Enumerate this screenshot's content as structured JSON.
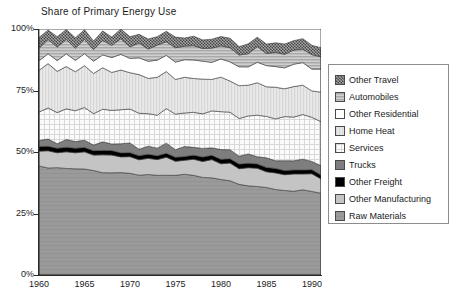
{
  "chart_data": {
    "type": "area",
    "stacked": true,
    "normalized_percent": true,
    "title": "Share of Primary Energy Use",
    "xlabel": "",
    "ylabel": "",
    "xlim": [
      1960,
      1991
    ],
    "ylim": [
      0,
      100
    ],
    "grid": false,
    "legend_position": "right",
    "x_tick_labels": [
      "1960",
      "1965",
      "1970",
      "1975",
      "1980",
      "1985",
      "1990"
    ],
    "x_ticks": [
      1960,
      1965,
      1970,
      1975,
      1980,
      1985,
      1990
    ],
    "y_tick_labels": [
      "0%",
      "25%",
      "50%",
      "75%",
      "100%"
    ],
    "y_ticks": [
      0,
      25,
      50,
      75,
      100
    ],
    "x": [
      1960,
      1961,
      1962,
      1963,
      1964,
      1965,
      1966,
      1967,
      1968,
      1969,
      1970,
      1971,
      1972,
      1973,
      1974,
      1975,
      1976,
      1977,
      1978,
      1979,
      1980,
      1981,
      1982,
      1983,
      1984,
      1985,
      1986,
      1987,
      1988,
      1989,
      1990,
      1991
    ],
    "stack_order_top_to_bottom": [
      "Other Travel",
      "Automobiles",
      "Other Residential",
      "Home Heat",
      "Services",
      "Trucks",
      "Other Freight",
      "Other Manufacturing",
      "Raw Materials"
    ],
    "series": [
      {
        "name": "Raw Materials",
        "pattern": "solid-medium-gray",
        "color": "#9a9a9a",
        "values": [
          44.0,
          43.8,
          43.6,
          43.4,
          43.2,
          43.0,
          42.7,
          42.4,
          42.2,
          42.0,
          41.8,
          41.5,
          41.2,
          41.0,
          40.6,
          40.2,
          41.0,
          40.4,
          39.8,
          39.3,
          38.8,
          38.2,
          37.6,
          37.2,
          36.8,
          36.3,
          35.8,
          35.3,
          34.8,
          34.3,
          33.8,
          33.4
        ]
      },
      {
        "name": "Other Manufacturing",
        "pattern": "solid-light-gray",
        "color": "#c4c4c4",
        "values": [
          7.0,
          7.0,
          7.0,
          7.0,
          7.0,
          7.0,
          7.0,
          7.0,
          7.0,
          7.0,
          7.0,
          7.0,
          7.0,
          7.0,
          7.0,
          7.0,
          7.0,
          7.0,
          7.0,
          7.0,
          7.0,
          7.0,
          7.0,
          7.0,
          7.0,
          7.0,
          7.0,
          7.0,
          7.0,
          7.0,
          7.0,
          7.0
        ]
      },
      {
        "name": "Other Freight",
        "pattern": "solid-black",
        "color": "#000000",
        "values": [
          1.8,
          1.8,
          1.8,
          1.8,
          1.8,
          1.8,
          1.8,
          1.8,
          1.8,
          1.8,
          1.8,
          1.8,
          1.8,
          1.8,
          1.8,
          1.8,
          1.8,
          1.8,
          1.8,
          1.8,
          1.8,
          1.8,
          1.8,
          1.8,
          1.8,
          1.8,
          1.8,
          1.8,
          1.8,
          1.8,
          1.8,
          1.8
        ]
      },
      {
        "name": "Trucks",
        "pattern": "solid-dark-gray",
        "color": "#7e7e7e",
        "values": [
          3.0,
          3.0,
          3.1,
          3.1,
          3.2,
          3.2,
          3.3,
          3.3,
          3.4,
          3.4,
          3.5,
          3.5,
          3.6,
          3.6,
          3.7,
          3.7,
          3.8,
          3.8,
          3.9,
          3.9,
          4.0,
          4.0,
          4.1,
          4.1,
          4.2,
          4.2,
          4.3,
          4.3,
          4.4,
          4.4,
          4.5,
          4.5
        ]
      },
      {
        "name": "Services",
        "pattern": "checkered-light",
        "color": "#ededed",
        "values": [
          12.0,
          12.2,
          12.4,
          12.6,
          12.8,
          13.0,
          13.2,
          13.4,
          13.6,
          13.8,
          14.0,
          14.2,
          14.4,
          14.6,
          14.8,
          15.0,
          14.6,
          15.0,
          15.3,
          15.6,
          15.9,
          16.2,
          16.5,
          16.7,
          16.9,
          17.1,
          17.3,
          17.5,
          17.7,
          17.9,
          18.1,
          18.2
        ]
      },
      {
        "name": "Home Heat",
        "pattern": "vertical-lines-light",
        "color": "#d6d6d6",
        "values": [
          18.0,
          17.8,
          17.6,
          17.4,
          17.2,
          17.0,
          16.8,
          16.6,
          16.4,
          16.2,
          16.0,
          15.8,
          15.6,
          15.4,
          15.2,
          15.0,
          14.7,
          14.4,
          14.2,
          14.0,
          13.8,
          13.6,
          13.4,
          13.2,
          13.0,
          12.8,
          12.6,
          12.4,
          12.2,
          12.0,
          11.8,
          11.7
        ]
      },
      {
        "name": "Other Residential",
        "pattern": "solid-white",
        "color": "#ffffff",
        "values": [
          4.2,
          4.4,
          4.6,
          4.8,
          5.0,
          5.2,
          5.4,
          5.6,
          5.8,
          6.0,
          6.2,
          6.4,
          6.6,
          6.8,
          7.0,
          7.2,
          7.4,
          7.6,
          7.8,
          8.0,
          8.2,
          8.4,
          8.6,
          8.8,
          9.0,
          9.2,
          9.4,
          9.6,
          9.8,
          10.0,
          10.2,
          10.3
        ]
      },
      {
        "name": "Automobiles",
        "pattern": "horizontal-lines-medium",
        "color": "#a8a8a8",
        "values": [
          6.0,
          6.0,
          6.0,
          6.0,
          6.0,
          6.0,
          6.0,
          6.0,
          6.0,
          6.0,
          6.0,
          6.0,
          6.0,
          6.0,
          6.0,
          6.0,
          6.0,
          6.0,
          6.0,
          6.0,
          6.0,
          6.0,
          6.0,
          6.0,
          6.0,
          6.0,
          6.0,
          6.0,
          6.0,
          6.0,
          6.0,
          6.0
        ]
      },
      {
        "name": "Other Travel",
        "pattern": "hatch-dark",
        "color": "#757575",
        "values": [
          4.0,
          4.0,
          3.9,
          3.9,
          3.8,
          3.8,
          3.8,
          3.9,
          3.8,
          3.8,
          3.7,
          3.8,
          3.8,
          3.8,
          3.9,
          3.9,
          3.7,
          3.8,
          3.8,
          3.8,
          3.9,
          3.8,
          3.8,
          3.9,
          3.9,
          3.9,
          3.9,
          3.9,
          3.9,
          3.9,
          3.9,
          3.9
        ]
      }
    ]
  },
  "legend": {
    "items": [
      {
        "label": "Other Travel",
        "pattern": "hatch-dark",
        "color": "#757575"
      },
      {
        "label": "Automobiles",
        "pattern": "horizontal-lines-medium",
        "color": "#a8a8a8"
      },
      {
        "label": "Other Residential",
        "pattern": "solid-white",
        "color": "#ffffff"
      },
      {
        "label": "Home Heat",
        "pattern": "vertical-lines-light",
        "color": "#d6d6d6"
      },
      {
        "label": "Services",
        "pattern": "checkered-light",
        "color": "#ededed"
      },
      {
        "label": "Trucks",
        "pattern": "solid-dark-gray",
        "color": "#7e7e7e"
      },
      {
        "label": "Other Freight",
        "pattern": "solid-black",
        "color": "#000000"
      },
      {
        "label": "Other Manufacturing",
        "pattern": "solid-light-gray",
        "color": "#c4c4c4"
      },
      {
        "label": "Raw Materials",
        "pattern": "solid-medium-gray",
        "color": "#9a9a9a"
      }
    ]
  }
}
